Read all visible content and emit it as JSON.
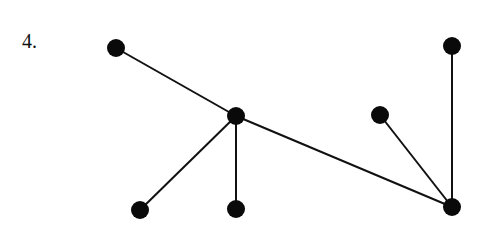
{
  "problem_label": "4.",
  "graph": {
    "edge_color": "#111111",
    "node_color": "#0a0a0a",
    "nodes": [
      {
        "id": "A",
        "x": 116,
        "y": 48
      },
      {
        "id": "B",
        "x": 236,
        "y": 116
      },
      {
        "id": "C",
        "x": 140,
        "y": 210
      },
      {
        "id": "D",
        "x": 236,
        "y": 209
      },
      {
        "id": "E",
        "x": 380,
        "y": 115
      },
      {
        "id": "F",
        "x": 452,
        "y": 46
      },
      {
        "id": "G",
        "x": 452,
        "y": 207
      }
    ],
    "edges": [
      [
        "A",
        "B"
      ],
      [
        "B",
        "C"
      ],
      [
        "B",
        "D"
      ],
      [
        "B",
        "G"
      ],
      [
        "E",
        "G"
      ],
      [
        "F",
        "G"
      ]
    ]
  }
}
